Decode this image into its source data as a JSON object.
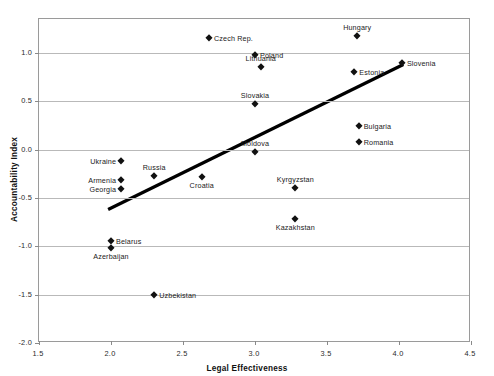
{
  "chart_data": {
    "type": "scatter",
    "title": "",
    "xlabel": "Legal Effectiveness",
    "ylabel": "Accountability Index",
    "xlim": [
      1.5,
      4.5
    ],
    "ylim": [
      -2.0,
      1.35
    ],
    "xticks": [
      "1.5",
      "2.0",
      "2.5",
      "3.0",
      "3.5",
      "4.0",
      "4.5"
    ],
    "xtick_values": [
      1.5,
      2.0,
      2.5,
      3.0,
      3.5,
      4.0,
      4.5
    ],
    "yticks": [
      "1.0",
      "0.5",
      "0.0",
      "-0.5",
      "-1.0",
      "-1.5",
      "-2.0"
    ],
    "ytick_values": [
      1.0,
      0.5,
      0.0,
      -0.5,
      -1.0,
      -1.5,
      -2.0
    ],
    "grid": true,
    "grid_axis": "y",
    "legend": "none",
    "marker_shape": "diamond",
    "marker_color": "#111111",
    "points": [
      {
        "label": "Czech Rep.",
        "x": 2.68,
        "y": 1.15,
        "label_pos": "right"
      },
      {
        "label": "Poland",
        "x": 3.0,
        "y": 0.98,
        "label_pos": "right"
      },
      {
        "label": "Lithuania",
        "x": 3.04,
        "y": 0.85,
        "label_pos": "above"
      },
      {
        "label": "Hungary",
        "x": 3.71,
        "y": 1.17,
        "label_pos": "above"
      },
      {
        "label": "Slovenia",
        "x": 4.02,
        "y": 0.9,
        "label_pos": "right"
      },
      {
        "label": "Estonia",
        "x": 3.69,
        "y": 0.8,
        "label_pos": "right"
      },
      {
        "label": "Slovakia",
        "x": 3.0,
        "y": 0.47,
        "label_pos": "above"
      },
      {
        "label": "Bulgaria",
        "x": 3.72,
        "y": 0.24,
        "label_pos": "right"
      },
      {
        "label": "Romania",
        "x": 3.72,
        "y": 0.08,
        "label_pos": "right"
      },
      {
        "label": "Moldova",
        "x": 3.0,
        "y": -0.02,
        "label_pos": "above"
      },
      {
        "label": "Ukraine",
        "x": 2.07,
        "y": -0.12,
        "label_pos": "left"
      },
      {
        "label": "Russia",
        "x": 2.3,
        "y": -0.27,
        "label_pos": "above"
      },
      {
        "label": "Armenia",
        "x": 2.07,
        "y": -0.31,
        "label_pos": "left"
      },
      {
        "label": "Croatia",
        "x": 2.63,
        "y": -0.28,
        "label_pos": "below"
      },
      {
        "label": "Georgia",
        "x": 2.07,
        "y": -0.41,
        "label_pos": "left"
      },
      {
        "label": "Kyrgyzstan",
        "x": 3.28,
        "y": -0.4,
        "label_pos": "above"
      },
      {
        "label": "Kazakhstan",
        "x": 3.28,
        "y": -0.72,
        "label_pos": "below"
      },
      {
        "label": "Belarus",
        "x": 2.0,
        "y": -0.95,
        "label_pos": "right"
      },
      {
        "label": "Azerbaijan",
        "x": 2.0,
        "y": -1.02,
        "label_pos": "below"
      },
      {
        "label": "Uzbekistan",
        "x": 2.3,
        "y": -1.5,
        "label_pos": "right"
      }
    ],
    "trendline": {
      "x_start": 1.98,
      "y_start": -0.62,
      "x_end": 4.03,
      "y_end": 0.88,
      "color": "#000000",
      "width_px": 3.2
    }
  }
}
